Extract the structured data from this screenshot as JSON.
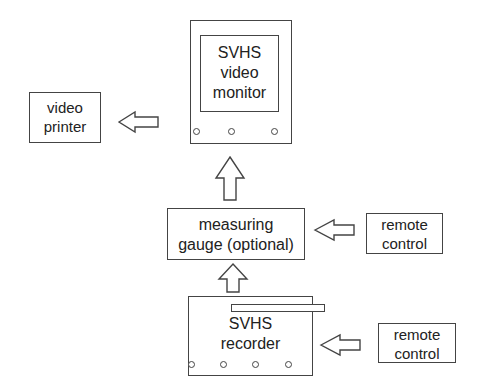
{
  "diagram": {
    "nodes": {
      "monitor": {
        "lines": [
          "SVHS",
          "video",
          "monitor"
        ]
      },
      "printer": {
        "lines": [
          "video",
          "printer"
        ]
      },
      "gauge": {
        "lines": [
          "measuring",
          "gauge (optional)"
        ]
      },
      "remote_top": {
        "lines": [
          "remote",
          "control"
        ]
      },
      "recorder": {
        "lines": [
          "SVHS",
          "recorder"
        ]
      },
      "remote_bottom": {
        "lines": [
          "remote",
          "control"
        ]
      }
    },
    "edges": [
      {
        "from": "monitor",
        "to": "printer",
        "direction": "left"
      },
      {
        "from": "gauge",
        "to": "monitor",
        "direction": "up"
      },
      {
        "from": "remote_top",
        "to": "gauge",
        "direction": "left"
      },
      {
        "from": "recorder",
        "to": "gauge",
        "direction": "up"
      },
      {
        "from": "remote_bottom",
        "to": "recorder",
        "direction": "left"
      }
    ]
  }
}
